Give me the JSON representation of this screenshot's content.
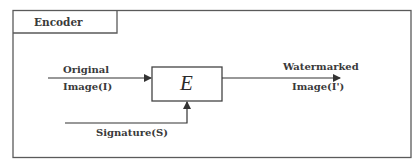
{
  "diagram": {
    "title": "Encoder",
    "block_label": "E",
    "inputs": {
      "image": {
        "line1": "Original",
        "line2": "Image(I)"
      },
      "signature": {
        "label": "Signature(S)"
      }
    },
    "output": {
      "line1": "Watermarked",
      "line2": "Image(I')"
    },
    "colors": {
      "stroke": "#5a5a5a",
      "text": "#3a3a3a",
      "background": "#ffffff"
    }
  }
}
